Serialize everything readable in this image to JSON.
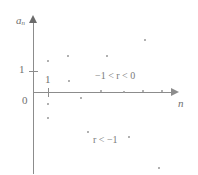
{
  "figure": {
    "background_color": "#ffffff",
    "ink_color": "#8c8c8c",
    "text_color": "#6f6f6f"
  },
  "axes": {
    "y_label": "a",
    "y_label_subscript": "n",
    "x_label": "n",
    "origin_label": "0",
    "y_tick_label": "1",
    "x_tick_label": "1"
  },
  "annotations": {
    "upper_region": "−1 < r < 0",
    "lower_region": "r < −1"
  },
  "chart_data": {
    "type": "scatter",
    "title": "",
    "xlabel": "n",
    "ylabel": "a_n",
    "grid": false,
    "legend": "none",
    "axis_origin_px": [
      33,
      92
    ],
    "xlim": [
      0,
      14
    ],
    "ylim": [
      -4,
      4
    ],
    "tick_labels": {
      "x": [
        "0",
        "1"
      ],
      "y": [
        "0",
        "1"
      ]
    },
    "annotations": [
      {
        "text": "−1 < r < 0",
        "x_px": 95,
        "y_px": 71
      },
      {
        "text": "r < −1",
        "x_px": 93,
        "y_px": 135
      }
    ],
    "series": [
      {
        "name": "-1 < r < 0",
        "comment": "damped alternating terms converging to 0",
        "points_px": [
          [
            68,
            56
          ],
          [
            48,
            61
          ],
          [
            69,
            81
          ],
          [
            48,
            104
          ],
          [
            48,
            118
          ],
          [
            81,
            98
          ],
          [
            101,
            91
          ],
          [
            124,
            92
          ],
          [
            143,
            91
          ],
          [
            162,
            91
          ]
        ]
      },
      {
        "name": "r < -1",
        "comment": "growing alternating terms diverging from 0",
        "points_px": [
          [
            145,
            40
          ],
          [
            107,
            56
          ],
          [
            88,
            132
          ],
          [
            129,
            137
          ],
          [
            159,
            168
          ]
        ]
      }
    ]
  }
}
